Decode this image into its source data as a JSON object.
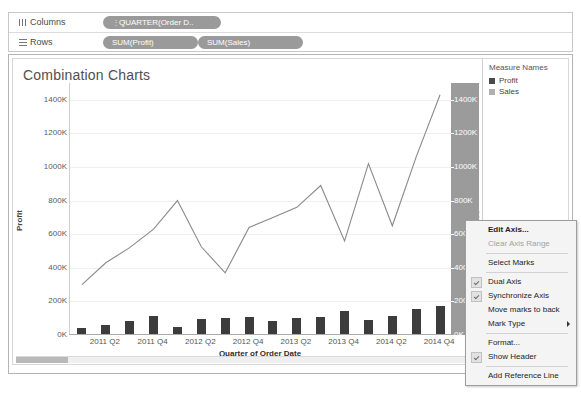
{
  "shelves": {
    "columns_label": "Columns",
    "rows_label": "Rows",
    "columns_pills": [
      {
        "label": "QUARTER(Order D.."
      }
    ],
    "rows_pills": [
      {
        "label": "SUM(Profit)"
      },
      {
        "label": "SUM(Sales)"
      }
    ]
  },
  "worksheet": {
    "title": "Combination Charts"
  },
  "legend": {
    "title": "Measure Names",
    "items": [
      {
        "label": "Profit",
        "color": "#4a4a4a"
      },
      {
        "label": "Sales",
        "color": "#9e9e9e"
      }
    ]
  },
  "context_menu": {
    "items": [
      {
        "label": "Edit Axis...",
        "bold": true,
        "checked": false,
        "disabled": false,
        "submenu": false
      },
      {
        "label": "Clear Axis Range",
        "bold": false,
        "checked": false,
        "disabled": true,
        "submenu": false
      },
      {
        "separator": true
      },
      {
        "label": "Select Marks",
        "bold": false,
        "checked": false,
        "disabled": false,
        "submenu": false
      },
      {
        "separator": true
      },
      {
        "label": "Dual Axis",
        "bold": false,
        "checked": true,
        "disabled": false,
        "submenu": false
      },
      {
        "label": "Synchronize Axis",
        "bold": false,
        "checked": true,
        "disabled": false,
        "submenu": false
      },
      {
        "label": "Move marks to back",
        "bold": false,
        "checked": false,
        "disabled": false,
        "submenu": false
      },
      {
        "label": "Mark Type",
        "bold": false,
        "checked": false,
        "disabled": false,
        "submenu": true
      },
      {
        "separator": true
      },
      {
        "label": "Format...",
        "bold": false,
        "checked": false,
        "disabled": false,
        "submenu": false
      },
      {
        "label": "Show Header",
        "bold": false,
        "checked": true,
        "disabled": false,
        "submenu": false
      },
      {
        "separator": true
      },
      {
        "label": "Add Reference Line",
        "bold": false,
        "checked": false,
        "disabled": false,
        "submenu": false
      }
    ]
  },
  "chart_data": {
    "type": "line",
    "title": "Combination Charts",
    "xlabel": "Quarter of Order Date",
    "ylabel": "Profit",
    "y2label": "Sales",
    "ylim": [
      0,
      1500000
    ],
    "y2lim": [
      0,
      1500000
    ],
    "grid": true,
    "legend_position": "right",
    "ytick_labels": [
      "1400K",
      "1200K",
      "1000K",
      "800K",
      "600K",
      "400K",
      "200K",
      "0K"
    ],
    "ytick_values": [
      1400000,
      1200000,
      1000000,
      800000,
      600000,
      400000,
      200000,
      0
    ],
    "y2tick_labels": [
      "1400K",
      "1200K",
      "1000K",
      "800K",
      "600",
      "400",
      "200",
      "0K"
    ],
    "y2tick_values": [
      1400000,
      1200000,
      1000000,
      800000,
      600000,
      400000,
      200000,
      0
    ],
    "x": [
      "2011 Q1",
      "2011 Q2",
      "2011 Q3",
      "2011 Q4",
      "2012 Q1",
      "2012 Q2",
      "2012 Q3",
      "2012 Q4",
      "2013 Q1",
      "2013 Q2",
      "2013 Q3",
      "2013 Q4",
      "2014 Q1",
      "2014 Q2",
      "2014 Q3",
      "2014 Q4"
    ],
    "xtick_labels": [
      "2011 Q2",
      "2011 Q4",
      "2012 Q2",
      "2012 Q4",
      "2013 Q2",
      "2013 Q4",
      "2014 Q2",
      "2014 Q4"
    ],
    "series": [
      {
        "name": "Sales",
        "type": "line",
        "color": "#8a8a8a",
        "values": [
          300000,
          430000,
          520000,
          630000,
          800000,
          525000,
          370000,
          640000,
          700000,
          760000,
          890000,
          560000,
          1020000,
          650000,
          1060000,
          1430000
        ]
      },
      {
        "name": "Profit",
        "type": "bar",
        "color": "#3c3c3c",
        "values": [
          38000,
          55000,
          78000,
          108000,
          40000,
          92000,
          95000,
          103000,
          78000,
          98000,
          102000,
          135000,
          84000,
          108000,
          150000,
          168000
        ]
      }
    ]
  }
}
